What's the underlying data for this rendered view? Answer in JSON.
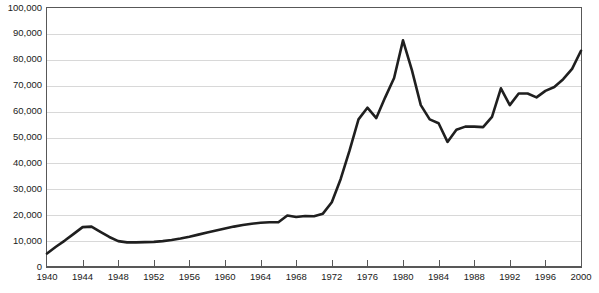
{
  "chart_data": {
    "type": "line",
    "title": "",
    "subtitle": "",
    "xlabel": "",
    "ylabel": "",
    "xlim": [
      1940,
      2000
    ],
    "ylim": [
      0,
      100000
    ],
    "grid": true,
    "legend": false,
    "legend_position": "none",
    "line_color": "#1f1f1f",
    "grid_color": "#d8d8d8",
    "axis_color": "#585858",
    "y_ticks": [
      0,
      10000,
      20000,
      30000,
      40000,
      50000,
      60000,
      70000,
      80000,
      90000,
      100000
    ],
    "y_tick_labels": [
      "0",
      "10,000",
      "20,000",
      "30,000",
      "40,000",
      "50,000",
      "60,000",
      "70,000",
      "80,000",
      "90,000",
      "100,000"
    ],
    "x_ticks": [
      1940,
      1944,
      1948,
      1952,
      1956,
      1960,
      1964,
      1968,
      1972,
      1976,
      1980,
      1984,
      1988,
      1992,
      1996,
      2000
    ],
    "x_tick_labels": [
      "1940",
      "1944",
      "1948",
      "1952",
      "1956",
      "1960",
      "1964",
      "1968",
      "1972",
      "1976",
      "1980",
      "1984",
      "1988",
      "1992",
      "1996",
      "2000"
    ],
    "x": [
      1940,
      1941,
      1942,
      1943,
      1944,
      1945,
      1946,
      1947,
      1948,
      1949,
      1950,
      1951,
      1952,
      1953,
      1954,
      1955,
      1956,
      1957,
      1958,
      1959,
      1960,
      1961,
      1962,
      1963,
      1964,
      1965,
      1966,
      1967,
      1968,
      1969,
      1970,
      1971,
      1972,
      1973,
      1974,
      1975,
      1976,
      1977,
      1978,
      1979,
      1980,
      1981,
      1982,
      1983,
      1984,
      1985,
      1986,
      1987,
      1988,
      1989,
      1990,
      1991,
      1992,
      1993,
      1994,
      1995,
      1996,
      1997,
      1998,
      1999,
      2000
    ],
    "values": [
      5200,
      7800,
      10200,
      12800,
      15400,
      15600,
      13600,
      11600,
      10000,
      9500,
      9500,
      9600,
      9700,
      10000,
      10400,
      11000,
      11700,
      12500,
      13300,
      14100,
      14900,
      15600,
      16200,
      16700,
      17100,
      17300,
      17300,
      19900,
      19300,
      19700,
      19600,
      20600,
      25000,
      34000,
      45000,
      57000,
      61500,
      57500,
      65500,
      73000,
      87500,
      76000,
      62500,
      57000,
      55500,
      48300,
      53000,
      54200,
      54200,
      54000,
      58000,
      69000,
      62500,
      67000,
      67000,
      65500,
      68000,
      69500,
      72500,
      76500,
      83500
    ],
    "series_name": "value"
  }
}
